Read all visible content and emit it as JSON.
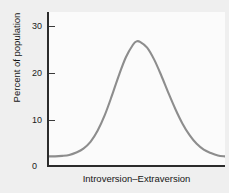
{
  "chart_data": {
    "type": "line",
    "title": "",
    "subtitle": "",
    "xlabel": "Introversion–Extraversion",
    "ylabel": "Percent of population",
    "grid": false,
    "legend": false,
    "legend_position": "none",
    "xlim": [
      0,
      100
    ],
    "ylim": [
      0,
      32
    ],
    "y_ticks": [
      0,
      10,
      20,
      30
    ],
    "y_tick_labels": [
      "0",
      "10",
      "20",
      "30"
    ],
    "x_ticks": [],
    "x_tick_labels": [],
    "series": [
      {
        "name": "Percent of population",
        "color": "#8d8d8d",
        "x": [
          0,
          4,
          8,
          12,
          16,
          20,
          24,
          28,
          32,
          36,
          40,
          44,
          48,
          50,
          52,
          56,
          60,
          64,
          68,
          72,
          76,
          80,
          84,
          88,
          92,
          96,
          100
        ],
        "values": [
          2.0,
          2.0,
          2.1,
          2.3,
          2.8,
          3.6,
          5.0,
          7.3,
          10.5,
          14.5,
          18.8,
          22.6,
          25.2,
          25.9,
          25.8,
          24.6,
          22.1,
          18.8,
          15.2,
          11.8,
          8.8,
          6.4,
          4.6,
          3.4,
          2.7,
          2.2,
          2.0
        ]
      }
    ],
    "peak": {
      "x": 50,
      "value": 26
    },
    "baseline_value": 2
  },
  "axes": {
    "y_title": "Percent of population",
    "x_title": "Introversion–Extraversion",
    "y_tick_labels": [
      "30",
      "20",
      "10",
      "0"
    ]
  },
  "colors": {
    "curve": "#8d8d8d",
    "axis": "#2b2b2b",
    "plot_background": "#fbfbfb",
    "figure_background": "#efefef",
    "text": "#161616"
  }
}
